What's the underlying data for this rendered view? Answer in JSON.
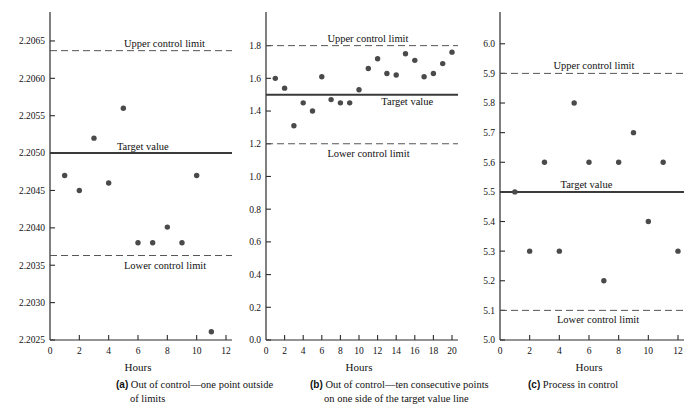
{
  "figure": {
    "type": "control-chart-figure",
    "panels": [
      "a",
      "b",
      "c"
    ]
  },
  "captions": [
    {
      "label": "(a)",
      "line1": "Out of control—one point outside",
      "line2": "of limits"
    },
    {
      "label": "(b)",
      "line1": "Out of control—ten consecutive points",
      "line2": "on one side of the target value line"
    },
    {
      "label": "(c)",
      "line1": "Process in control",
      "line2": ""
    }
  ],
  "annotations": {
    "upper": "Upper control limit",
    "lower": "Lower control limit",
    "target": "Target value",
    "xlabel": "Hours"
  },
  "chart_data": [
    {
      "id": "a",
      "type": "scatter",
      "title": "",
      "xlabel": "Hours",
      "ylabel": "",
      "xlim": [
        0,
        12
      ],
      "ylim": [
        2.2025,
        2.2067
      ],
      "xticks": [
        0,
        2,
        4,
        6,
        8,
        10,
        12
      ],
      "xticklabels": [
        "0",
        "2",
        "4",
        "6",
        "8",
        "10",
        "12"
      ],
      "yticks": [
        2.2025,
        2.203,
        2.2035,
        2.204,
        2.2045,
        2.205,
        2.2055,
        2.206,
        2.2065
      ],
      "yticklabels": [
        "2.2025",
        "2.2030",
        "2.2035",
        "2.2040",
        "2.2045",
        "2.2050",
        "2.2055",
        "2.2060",
        "2.2065"
      ],
      "grid": false,
      "target_value": 2.205,
      "upper_control_limit": 2.20637,
      "lower_control_limit": 2.20363,
      "x": [
        1,
        2,
        3,
        4,
        5,
        6,
        7,
        8,
        9,
        10,
        11
      ],
      "values": [
        2.2047,
        2.2045,
        2.2052,
        2.2046,
        2.2056,
        2.2038,
        2.2038,
        2.20401,
        2.2038,
        2.2047,
        2.20261
      ]
    },
    {
      "id": "b",
      "type": "scatter",
      "title": "",
      "xlabel": "Hours",
      "ylabel": "",
      "xlim": [
        0,
        20
      ],
      "ylim": [
        0.0,
        1.92
      ],
      "xticks": [
        0,
        2,
        4,
        6,
        8,
        10,
        12,
        14,
        16,
        18,
        20
      ],
      "xticklabels": [
        "0",
        "2",
        "4",
        "6",
        "8",
        "10",
        "12",
        "14",
        "16",
        "18",
        "20"
      ],
      "yticks": [
        0.0,
        0.2,
        0.4,
        0.6,
        0.8,
        1.0,
        1.2,
        1.4,
        1.6,
        1.8
      ],
      "yticklabels": [
        "0.0",
        "0.2",
        "0.4",
        "0.6",
        "0.8",
        "1.0",
        "1.2",
        "1.4",
        "1.6",
        "1.8"
      ],
      "grid": false,
      "target_value": 1.5,
      "upper_control_limit": 1.8,
      "lower_control_limit": 1.2,
      "x": [
        1,
        2,
        3,
        4,
        5,
        6,
        7,
        8,
        9,
        10,
        11,
        12,
        13,
        14,
        15,
        16,
        17,
        18,
        19,
        20
      ],
      "values": [
        1.6,
        1.54,
        1.31,
        1.45,
        1.4,
        1.61,
        1.47,
        1.45,
        1.45,
        1.53,
        1.66,
        1.72,
        1.63,
        1.62,
        1.75,
        1.71,
        1.61,
        1.63,
        1.69,
        1.76
      ]
    },
    {
      "id": "c",
      "type": "scatter",
      "title": "",
      "xlabel": "Hours",
      "ylabel": "",
      "xlim": [
        0,
        12
      ],
      "ylim": [
        5.0,
        6.06
      ],
      "xticks": [
        0,
        2,
        4,
        6,
        8,
        10,
        12
      ],
      "xticklabels": [
        "0",
        "2",
        "4",
        "6",
        "8",
        "10",
        "12"
      ],
      "yticks": [
        5.0,
        5.1,
        5.2,
        5.3,
        5.4,
        5.5,
        5.6,
        5.7,
        5.8,
        5.9,
        6.0
      ],
      "yticklabels": [
        "5.0",
        "5.1",
        "5.2",
        "5.3",
        "5.4",
        "5.5",
        "5.6",
        "5.7",
        "5.8",
        "5.9",
        "6.0"
      ],
      "grid": false,
      "target_value": 5.5,
      "upper_control_limit": 5.9,
      "lower_control_limit": 5.1,
      "x": [
        1,
        2,
        3,
        4,
        5,
        6,
        7,
        8,
        9,
        10,
        11,
        12
      ],
      "values": [
        5.5,
        5.3,
        5.6,
        5.3,
        5.8,
        5.6,
        5.2,
        5.6,
        5.7,
        5.4,
        5.6,
        5.3
      ]
    }
  ]
}
